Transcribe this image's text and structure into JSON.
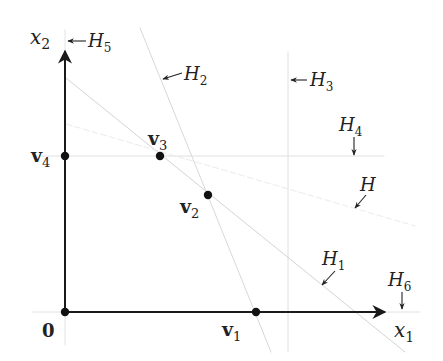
{
  "diagram": {
    "type": "polytope-hyperplanes",
    "colors": {
      "axis": "#1a1a1a",
      "hyperplane": "#d6d6d6",
      "faint_hyperplane": "#e6e6e6",
      "vertex": "#111111",
      "text": "#222222"
    },
    "axes": {
      "x1": {
        "base": "x",
        "sub": "1"
      },
      "x2": {
        "base": "x",
        "sub": "2"
      },
      "origin_label": "0"
    },
    "vertices": [
      {
        "id": "v1",
        "base": "v",
        "sub": "1"
      },
      {
        "id": "v2",
        "base": "v",
        "sub": "2"
      },
      {
        "id": "v3",
        "base": "v",
        "sub": "3"
      },
      {
        "id": "v4",
        "base": "v",
        "sub": "4"
      }
    ],
    "hyperplanes": [
      {
        "id": "H1",
        "base": "H",
        "sub": "1"
      },
      {
        "id": "H2",
        "base": "H",
        "sub": "2"
      },
      {
        "id": "H3",
        "base": "H",
        "sub": "3"
      },
      {
        "id": "H4",
        "base": "H",
        "sub": "4"
      },
      {
        "id": "H5",
        "base": "H",
        "sub": "5"
      },
      {
        "id": "H6",
        "base": "H",
        "sub": "6"
      },
      {
        "id": "H",
        "base": "H",
        "sub": ""
      }
    ]
  }
}
